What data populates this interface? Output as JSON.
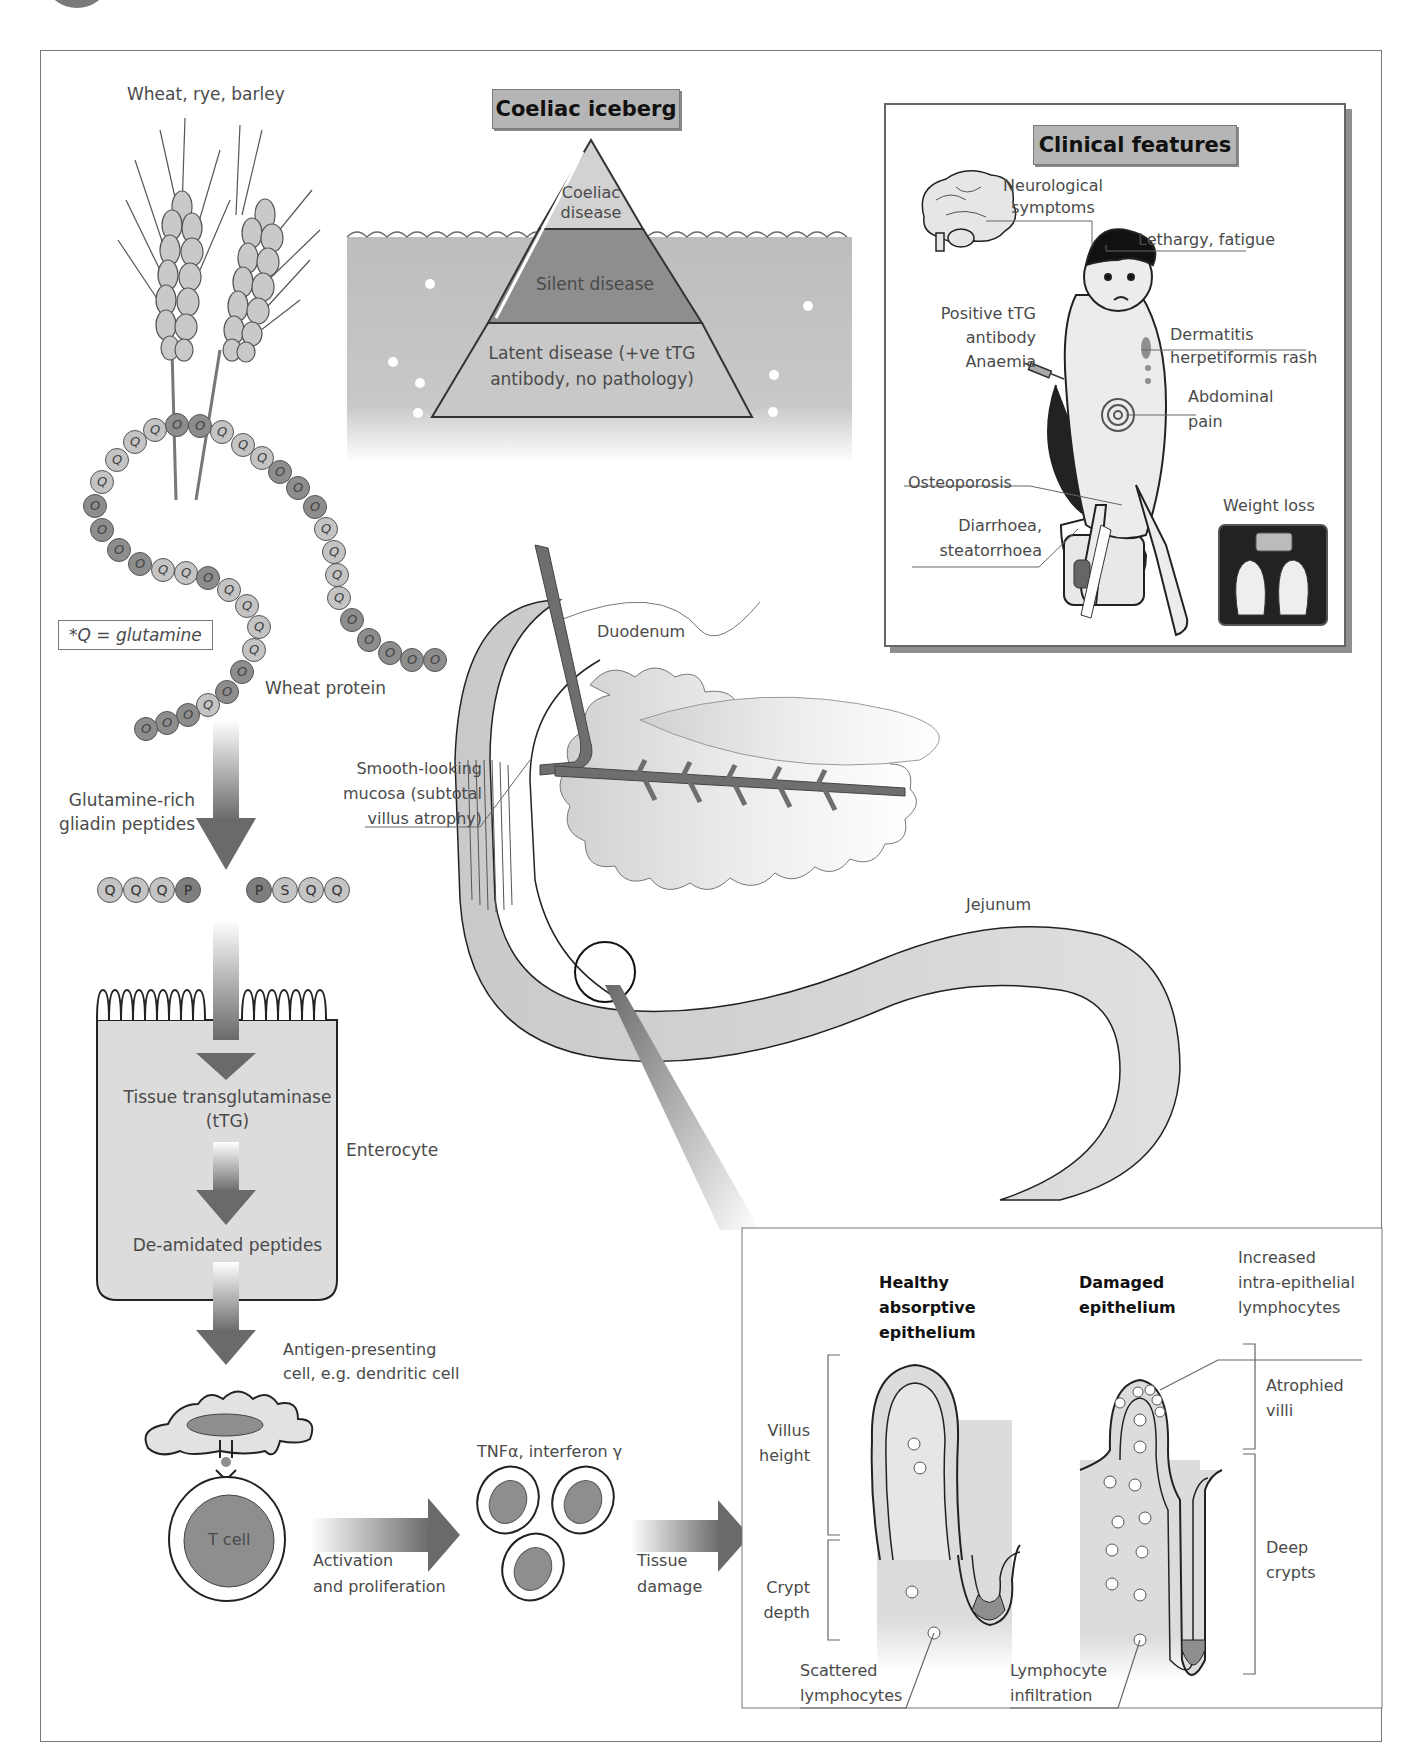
{
  "figure": {
    "frame_label": "Coeliac disease pathophysiology",
    "colors": {
      "dark_grey": "#6e6e6e",
      "mid_grey": "#9a9a9a",
      "light_grey": "#d6d6d6",
      "title_box": "#b5b5b5",
      "water": "#bdbdbd"
    }
  },
  "grain": {
    "label": "Wheat, rye, barley",
    "protein_label": "Wheat protein",
    "key_label": "*Q = glutamine",
    "bead_sequence": [
      "O",
      "O",
      "O",
      "Q",
      "O",
      "O",
      "Q",
      "Q",
      "Q",
      "Q",
      "O",
      "Q",
      "Q",
      "O",
      "Q",
      "Q",
      "O",
      "O",
      "O",
      "O",
      "Q",
      "Q",
      "Q",
      "O",
      "O",
      "Q",
      "Q",
      "O",
      "O",
      "O",
      "Q",
      "Q",
      "Q",
      "Q",
      "O",
      "O",
      "O",
      "O",
      "O"
    ]
  },
  "iceberg": {
    "title": "Coeliac iceberg",
    "tiers": [
      {
        "label": "Coeliac\ndisease",
        "position": "tip"
      },
      {
        "label": "Silent disease",
        "position": "middle"
      },
      {
        "label": "Latent disease (+ve tTG\nantibody, no pathology)",
        "position": "base"
      }
    ]
  },
  "clinical": {
    "title": "Clinical features",
    "features": [
      {
        "label": "Neurological\nsymptoms"
      },
      {
        "label": "Lethargy, fatigue"
      },
      {
        "label": "Positive tTG\nantibody\nAnaemia"
      },
      {
        "label": "Dermatitis\nherpetiformis rash"
      },
      {
        "label": "Abdominal\npain"
      },
      {
        "label": "Osteoporosis"
      },
      {
        "label": "Weight loss"
      },
      {
        "label": "Diarrhoea,\nsteatorrhoea"
      }
    ]
  },
  "pathway": {
    "gliadin_label": "Glutamine-rich\ngliadin peptides",
    "peptide_left": [
      "Q",
      "Q",
      "Q",
      "P"
    ],
    "peptide_right": [
      "P",
      "S",
      "Q",
      "Q"
    ],
    "enterocyte_label": "Enterocyte",
    "ttg_label": "Tissue transglutaminase\n(tTG)",
    "deamidated_label": "De-amidated peptides",
    "apc_label": "Antigen-presenting\ncell, e.g. dendritic cell",
    "tcell_label": "T cell",
    "activation_label": "Activation\nand proliferation",
    "cytokine_label": "TNFα, interferon γ",
    "damage_label": "Tissue\ndamage"
  },
  "intestine": {
    "duodenum_label": "Duodenum",
    "jejunum_label": "Jejunum",
    "mucosa_label": "Smooth-looking\nmucosa (subtotal\nvillus atrophy)"
  },
  "histology": {
    "healthy_title": "Healthy\nabsorptive\nepithelium",
    "damaged_title": "Damaged\nepithelium",
    "villus_height_label": "Villus\nheight",
    "crypt_depth_label": "Crypt\ndepth",
    "scattered_label": "Scattered\nlymphocytes",
    "infiltration_label": "Lymphocyte\ninfiltration",
    "iel_label": "Increased\nintra-epithelial\nlymphocytes",
    "atrophied_label": "Atrophied\nvilli",
    "deep_crypts_label": "Deep\ncrypts"
  }
}
